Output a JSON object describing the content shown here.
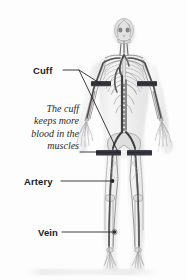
{
  "figure": {
    "view": "anterior full-body",
    "background_color": "#fdfdfd",
    "artwork_style": "grayscale anatomical illustration",
    "ink_color": "#6f6f6f",
    "cuff_color": "#32323a",
    "leader_line_color": "#1c1c1c"
  },
  "labels": {
    "cuff": "Cuff",
    "artery": "Artery",
    "vein": "Vein"
  },
  "note": {
    "lines": [
      "The cuff",
      "keeps more",
      "blood in the",
      "muscles"
    ]
  },
  "annotations": [
    {
      "name": "cuff",
      "text": "Cuff",
      "targets": [
        "left-upper-arm-cuff",
        "left-thigh-cuff"
      ],
      "leader_count": 2
    },
    {
      "name": "note",
      "text": "The cuff keeps more blood in the muscles",
      "targets": [
        "left-thigh-cuff"
      ],
      "leader_count": 1
    },
    {
      "name": "artery",
      "text": "Artery",
      "targets": [
        "left-femoral-artery"
      ],
      "leader_count": 1
    },
    {
      "name": "vein",
      "text": "Vein",
      "targets": [
        "left-lower-leg-vein"
      ],
      "leader_count": 1
    }
  ],
  "cuffs": [
    {
      "name": "right-upper-arm-cuff",
      "location": "right upper arm"
    },
    {
      "name": "left-upper-arm-cuff",
      "location": "left upper arm"
    },
    {
      "name": "right-thigh-cuff",
      "location": "right upper thigh"
    },
    {
      "name": "left-thigh-cuff",
      "location": "left upper thigh"
    }
  ]
}
